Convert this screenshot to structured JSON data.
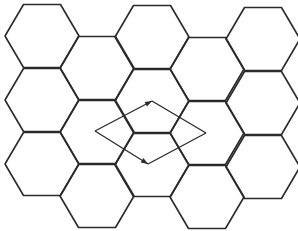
{
  "diagram": {
    "type": "hexagonal-lattice",
    "colors": {
      "background": "#ffffff",
      "stroke": "#2a2a2a"
    },
    "hexagon": {
      "orientation": "flat-top",
      "side": 37,
      "half_height": 31.5,
      "column_step": 55
    },
    "hexagons": [
      {
        "cx": 42,
        "cy": 36
      },
      {
        "cx": 42,
        "cy": 100
      },
      {
        "cx": 42,
        "cy": 164
      },
      {
        "cx": 97,
        "cy": 68
      },
      {
        "cx": 97,
        "cy": 132
      },
      {
        "cx": 97,
        "cy": 196
      },
      {
        "cx": 152,
        "cy": 37
      },
      {
        "cx": 152,
        "cy": 101
      },
      {
        "cx": 152,
        "cy": 165
      },
      {
        "cx": 207,
        "cy": 69
      },
      {
        "cx": 207,
        "cy": 133
      },
      {
        "cx": 207,
        "cy": 197
      },
      {
        "cx": 263,
        "cy": 39
      },
      {
        "cx": 263,
        "cy": 103
      },
      {
        "cx": 263,
        "cy": 167
      }
    ],
    "lattice_vectors": {
      "origin": {
        "x": 95,
        "y": 131
      },
      "vectors": [
        {
          "name": "a1",
          "tip": {
            "x": 152,
            "y": 101
          },
          "arrow": true
        },
        {
          "name": "a2",
          "tip": {
            "x": 148,
            "y": 164
          },
          "arrow": true
        }
      ],
      "rhombus_far_vertex": {
        "x": 206,
        "y": 133
      },
      "closing_edges": [
        {
          "from": {
            "x": 152,
            "y": 101
          },
          "to": {
            "x": 206,
            "y": 133
          }
        },
        {
          "from": {
            "x": 148,
            "y": 164
          },
          "to": {
            "x": 206,
            "y": 133
          }
        }
      ]
    }
  }
}
